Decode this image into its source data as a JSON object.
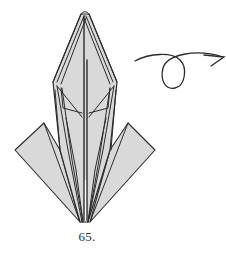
{
  "diagram": {
    "step_number": "65.",
    "arrow": {
      "type": "turn-over-arrow",
      "meaning": "turn the model over"
    },
    "colors": {
      "paper_fill": "#d9d9d9",
      "line": "#2b2b2b",
      "background": "#ffffff"
    }
  }
}
